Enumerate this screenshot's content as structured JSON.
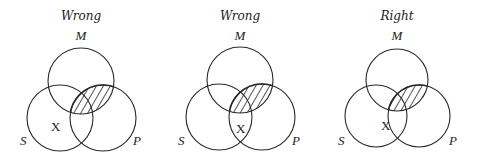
{
  "diagrams": [
    {
      "title": "Wrong",
      "offset_x": 0,
      "labels": {
        "M": "M",
        "S": "S",
        "P": "P"
      },
      "mark": "X",
      "mark_position": "S only (outside P)",
      "shaded_region": "M ∩ P (upper overlap)"
    },
    {
      "title": "Wrong",
      "offset_x": 159,
      "labels": {
        "M": "M",
        "S": "S",
        "P": "P"
      },
      "mark": "X",
      "mark_position": "S ∩ P (outside M)",
      "shaded_region": "M ∩ P (upper overlap)"
    },
    {
      "title": "Right",
      "offset_x": 317,
      "labels": {
        "M": "M",
        "S": "S",
        "P": "P"
      },
      "mark": "X",
      "mark_position": "on P boundary within S",
      "shaded_region": "M ∩ P (upper overlap)"
    }
  ],
  "colors": {
    "stroke": "#2a2a2a",
    "background": "#ffffff"
  }
}
